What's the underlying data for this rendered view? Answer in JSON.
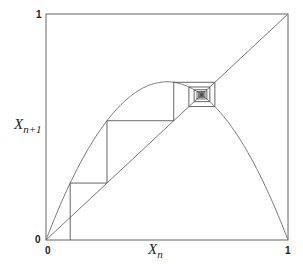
{
  "chart_data": {
    "type": "line",
    "title": "",
    "subtitle": "Cobweb plot of logistic map x_{n+1} = r x_n (1 - x_n)",
    "xlabel": "X_n",
    "ylabel": "X_{n+1}",
    "xlim": [
      0,
      1
    ],
    "ylim": [
      0,
      1
    ],
    "grid": false,
    "legend": null,
    "x_ticks": [
      "0",
      "1"
    ],
    "y_ticks": [
      "0",
      "1"
    ],
    "r": 2.8,
    "x0": 0.1,
    "iterations": 60,
    "series": [
      {
        "name": "logistic curve",
        "function": "r*x*(1-x)",
        "peak": {
          "x": 0.5,
          "y": 0.7
        }
      },
      {
        "name": "identity line",
        "function": "y=x"
      },
      {
        "name": "cobweb",
        "fixed_point": 0.643,
        "first_iterates": [
          0.1,
          0.252,
          0.528,
          0.698,
          0.59,
          0.677,
          0.612,
          0.665,
          0.624
        ]
      }
    ]
  },
  "labels": {
    "x_axis_main": "X",
    "x_axis_sub": "n",
    "y_axis_main": "X",
    "y_axis_sub": "n+1",
    "tick_x0": "0",
    "tick_x1": "1",
    "tick_y0": "0",
    "tick_y1": "1"
  },
  "colors": {
    "axes": "#555555",
    "curve": "#777777",
    "cobweb": "#555555"
  }
}
